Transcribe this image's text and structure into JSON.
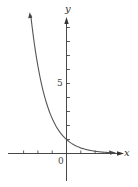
{
  "chart_data": {
    "type": "line",
    "title": "",
    "xlabel": "x",
    "ylabel": "y",
    "function_description": "decreasing exponential curve, approx y = (0.4)^x",
    "x": [
      -2.5,
      -2,
      -1.5,
      -1,
      -0.5,
      0,
      0.5,
      1,
      1.5,
      2,
      2.5,
      3.2
    ],
    "series": [
      {
        "name": "curve",
        "values": [
          9.9,
          6.25,
          3.95,
          2.5,
          1.58,
          1.0,
          0.63,
          0.4,
          0.25,
          0.16,
          0.1,
          0.05
        ]
      }
    ],
    "xlim": [
      -4.1,
      3.8
    ],
    "ylim": [
      -2,
      10
    ],
    "x_ticks": [
      -3,
      -2,
      -1,
      1,
      2,
      3
    ],
    "y_ticks": [
      1,
      2,
      3,
      4,
      5,
      6,
      7,
      8,
      9
    ],
    "tick_labels": {
      "origin": "0",
      "y_five": "5"
    },
    "grid": false,
    "legend": "none",
    "arrows": [
      "x-axis positive end",
      "y-axis positive end",
      "curve upper-left end",
      "curve right end"
    ]
  },
  "labels": {
    "x_axis": "x",
    "y_axis": "y",
    "origin": "0",
    "five": "5"
  },
  "colors": {
    "axis": "#333333",
    "curve": "#555555"
  }
}
